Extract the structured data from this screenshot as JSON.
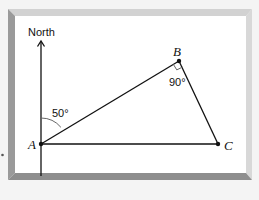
{
  "diagram": {
    "type": "geometry-bearing-triangle",
    "north_label": "North",
    "points": {
      "A": {
        "label": "A",
        "x": 41,
        "y": 144
      },
      "B": {
        "label": "B",
        "x": 179,
        "y": 61
      },
      "C": {
        "label": "C",
        "x": 218,
        "y": 144
      }
    },
    "angles": {
      "north_to_AB": {
        "label": "50°",
        "vertex": "A"
      },
      "ABC": {
        "label": "90°",
        "vertex": "B",
        "right_angle": true
      }
    },
    "colors": {
      "background": "#f4f4f4",
      "panel": "#ffffff",
      "frame_dark": "#8e8e8e",
      "frame_light": "#cfcfcf",
      "line": "#111111",
      "arc": "#666666"
    }
  }
}
